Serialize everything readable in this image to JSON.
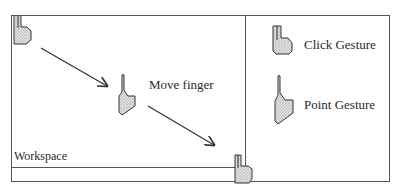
{
  "workspace": {
    "label": "Workspace"
  },
  "annotations": {
    "move_label": "Move finger"
  },
  "legend": {
    "items": [
      {
        "icon": "click-gesture-hand-icon",
        "label": "Click Gesture"
      },
      {
        "icon": "point-gesture-hand-icon",
        "label": "Point Gesture"
      }
    ]
  },
  "colors": {
    "border": "#555555",
    "hand_fill": "#cfcfcf",
    "hand_stroke": "#333333",
    "arrow": "#333333"
  }
}
